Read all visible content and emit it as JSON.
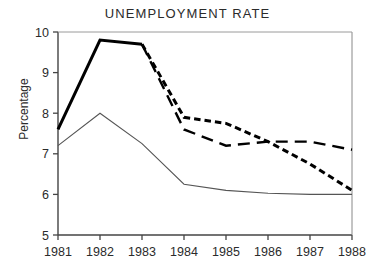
{
  "chart_data": {
    "type": "line",
    "title": "UNEMPLOYMENT RATE",
    "xlabel": "",
    "ylabel": "Percentage",
    "categories": [
      "1981",
      "1982",
      "1983",
      "1984",
      "1985",
      "1986",
      "1987",
      "1988"
    ],
    "x": [
      1981,
      1982,
      1983,
      1984,
      1985,
      1986,
      1987,
      1988
    ],
    "xlim": [
      1981,
      1988
    ],
    "ylim": [
      5,
      10
    ],
    "ytick_labels": [
      "5",
      "6",
      "7",
      "8",
      "9",
      "10"
    ],
    "yticks": [
      5,
      6,
      7,
      8,
      9,
      10
    ],
    "grid": false,
    "legend": "none",
    "series": [
      {
        "name": "history-thick-solid",
        "style": "solid-thick",
        "color": "#000000",
        "x": [
          1981,
          1982,
          1983
        ],
        "values": [
          7.6,
          9.8,
          9.7
        ]
      },
      {
        "name": "projection-short-dash",
        "style": "dashed-short",
        "color": "#000000",
        "x": [
          1983,
          1984,
          1985,
          1986,
          1987,
          1988
        ],
        "values": [
          9.7,
          7.9,
          7.75,
          7.3,
          6.75,
          6.1
        ]
      },
      {
        "name": "projection-long-dash",
        "style": "dashed-long",
        "color": "#000000",
        "x": [
          1983,
          1984,
          1985,
          1986,
          1987,
          1988
        ],
        "values": [
          9.7,
          7.6,
          7.2,
          7.3,
          7.3,
          7.1
        ]
      },
      {
        "name": "baseline-thin-solid",
        "style": "solid-thin",
        "color": "#555555",
        "x": [
          1981,
          1982,
          1983,
          1984,
          1985,
          1986,
          1987,
          1988
        ],
        "values": [
          7.2,
          8.0,
          7.25,
          6.25,
          6.1,
          6.03,
          6.0,
          6.0
        ]
      }
    ]
  }
}
